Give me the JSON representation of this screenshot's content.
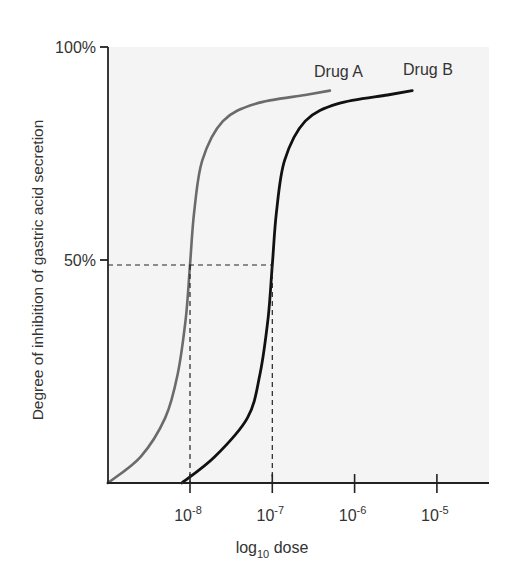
{
  "chart_data": {
    "type": "line",
    "title": "",
    "xlabel": "log10 dose",
    "xlabel_parts": {
      "base": "log",
      "sub": "10",
      "rest": " dose"
    },
    "ylabel": "Degree of inhibition of gastric acid secretion",
    "x_scale": "log",
    "x_ticks": [
      {
        "base": "10",
        "exp": "-8",
        "value": 1e-08
      },
      {
        "base": "10",
        "exp": "-7",
        "value": 1e-07
      },
      {
        "base": "10",
        "exp": "-6",
        "value": 1e-06
      },
      {
        "base": "10",
        "exp": "-5",
        "value": 1e-05
      }
    ],
    "y_ticks": [
      {
        "label": "50%",
        "value": 50
      },
      {
        "label": "100%",
        "value": 100
      }
    ],
    "ylim": [
      0,
      100
    ],
    "xlim_log10": [
      -9.0,
      -4.4
    ],
    "grid": false,
    "series": [
      {
        "name": "Drug A",
        "color": "#6b6b6b",
        "ec50": 1e-08,
        "max_effect": 90,
        "x_log10": [
          -9.0,
          -8.6,
          -8.3,
          -8.15,
          -8.05,
          -8.0,
          -7.95,
          -7.85,
          -7.6,
          -7.2,
          -6.6,
          -6.3
        ],
        "values": [
          0,
          6,
          15,
          25,
          38,
          50,
          62,
          74,
          83,
          87,
          89,
          90
        ]
      },
      {
        "name": "Drug B",
        "color": "#111111",
        "ec50": 1e-07,
        "max_effect": 90,
        "x_log10": [
          -8.1,
          -7.7,
          -7.3,
          -7.15,
          -7.05,
          -7.0,
          -6.95,
          -6.85,
          -6.6,
          -6.2,
          -5.6,
          -5.3
        ],
        "values": [
          0,
          6,
          15,
          25,
          38,
          50,
          62,
          74,
          83,
          87,
          89,
          90
        ]
      }
    ],
    "annotations": [
      {
        "type": "dashed-line",
        "desc": "50% level from y-axis to Drug B curve"
      },
      {
        "type": "dashed-line",
        "desc": "vertical drop from Drug A at 50% to 10^-8"
      },
      {
        "type": "dashed-line",
        "desc": "vertical drop from Drug B at 50% to 10^-7"
      }
    ],
    "legend": "inline labels at curve ends",
    "plot_background": "#f4f4f4"
  }
}
